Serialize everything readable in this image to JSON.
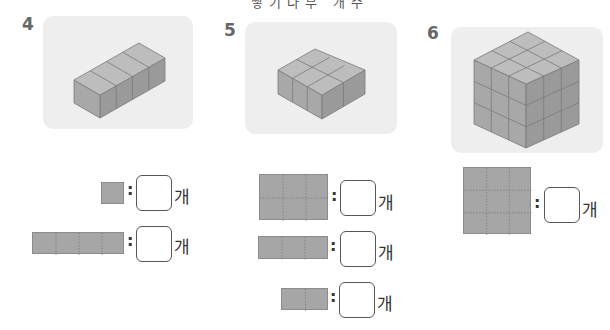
{
  "page": {
    "title_partial": "쌓기나무 개수"
  },
  "problems": [
    {
      "number": "4",
      "shape": "1x4x1 row of cubes",
      "rows": [
        {
          "face": "1x1 square",
          "colon": ":",
          "answer": "",
          "unit": "개"
        },
        {
          "face": "1x4 strip",
          "colon": ":",
          "answer": "",
          "unit": "개"
        }
      ]
    },
    {
      "number": "5",
      "shape": "2x3x1 slab of cubes",
      "rows": [
        {
          "face": "2x3 rectangle",
          "colon": ":",
          "answer": "",
          "unit": "개"
        },
        {
          "face": "1x3 strip",
          "colon": ":",
          "answer": "",
          "unit": "개"
        },
        {
          "face": "1x2 strip",
          "colon": ":",
          "answer": "",
          "unit": "개"
        }
      ]
    },
    {
      "number": "6",
      "shape": "3x3x3 cube",
      "rows": [
        {
          "face": "3x3 square",
          "colon": ":",
          "answer": "",
          "unit": "개"
        }
      ]
    }
  ],
  "colors": {
    "card_bg": "#eeeeee",
    "cube_top": "#bdbdbd",
    "cube_left": "#a8a8a8",
    "cube_right": "#9a9a9a",
    "face_fill": "#a6a6a6"
  }
}
